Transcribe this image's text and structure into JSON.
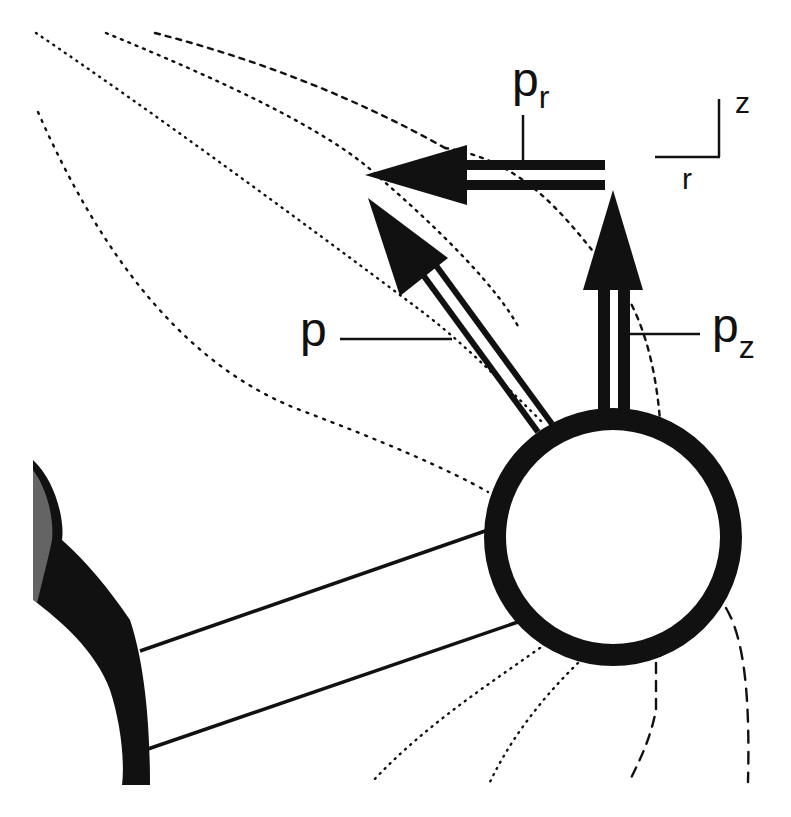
{
  "figure": {
    "colors": {
      "ink": "#111111",
      "background": "#ffffff"
    }
  },
  "labels": {
    "p": {
      "main": "p",
      "sub": ""
    },
    "p_r": {
      "main": "p",
      "sub": "r"
    },
    "p_z": {
      "main": "p",
      "sub": "z"
    }
  },
  "axes_legend": {
    "vertical_label": "z",
    "horizontal_label": "r"
  },
  "vectors": [
    {
      "name": "p",
      "direction": "up-left diagonal"
    },
    {
      "name": "p_r",
      "direction": "left (radial)"
    },
    {
      "name": "p_z",
      "direction": "up (axial)"
    }
  ],
  "objects": [
    {
      "name": "sphere",
      "description": "Atom / sphere at right end of rod"
    },
    {
      "name": "rod",
      "description": "Cylindrical rod connecting sphere to left body"
    },
    {
      "name": "left-body",
      "description": "Partial large body at left edge"
    }
  ]
}
